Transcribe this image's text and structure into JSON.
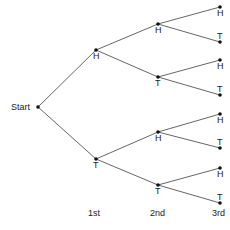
{
  "diagram": {
    "type": "probability-tree",
    "root_label": "Start",
    "stage_labels": [
      "1st",
      "2nd",
      "3rd"
    ],
    "nodes": {
      "start": {
        "x": 38,
        "y": 107,
        "label": "Start"
      },
      "s1": [
        {
          "x": 96,
          "y": 50,
          "label": "H"
        },
        {
          "x": 96,
          "y": 159,
          "label": "T"
        }
      ],
      "s2": [
        {
          "x": 158,
          "y": 24,
          "label": "H"
        },
        {
          "x": 158,
          "y": 77,
          "label": "T"
        },
        {
          "x": 158,
          "y": 132,
          "label": "H"
        },
        {
          "x": 158,
          "y": 185,
          "label": "T"
        }
      ],
      "s3": [
        {
          "x": 220,
          "y": 7,
          "label": "H"
        },
        {
          "x": 220,
          "y": 42,
          "label": "T"
        },
        {
          "x": 220,
          "y": 60,
          "label": "H"
        },
        {
          "x": 220,
          "y": 95,
          "label": "T"
        },
        {
          "x": 220,
          "y": 114,
          "label": "H"
        },
        {
          "x": 220,
          "y": 148,
          "label": "T"
        },
        {
          "x": 220,
          "y": 168,
          "label": "H"
        },
        {
          "x": 220,
          "y": 203,
          "label": "T"
        }
      ]
    },
    "colors": {
      "line": "#555555",
      "dot": "#111111",
      "text": "#222222"
    }
  }
}
